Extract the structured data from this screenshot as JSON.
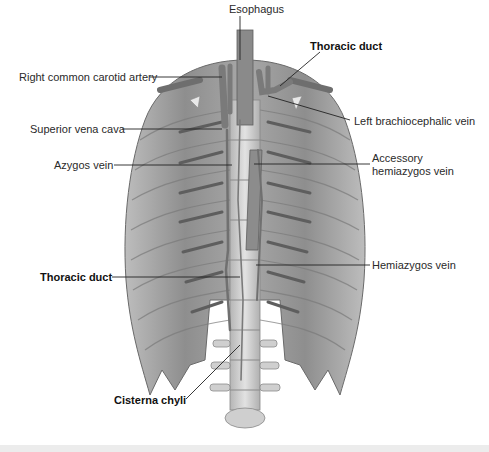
{
  "figure": {
    "type": "anatomical-diagram",
    "labels": [
      {
        "id": "esophagus",
        "text": "Esophagus",
        "bold": false,
        "x": 229,
        "y": 9
      },
      {
        "id": "thoracic-duct-top",
        "text": "Thoracic duct",
        "bold": true,
        "x": 310,
        "y": 46
      },
      {
        "id": "right-common-carotid-artery",
        "text": "Right common carotid artery",
        "bold": false,
        "x": 19,
        "y": 71
      },
      {
        "id": "left-brachiocephalic-vein",
        "text": "Left brachiocephalic vein",
        "bold": false,
        "x": 354,
        "y": 115
      },
      {
        "id": "superior-vena-cava",
        "text": "Superior vena cava",
        "bold": false,
        "x": 30,
        "y": 123
      },
      {
        "id": "azygos-vein",
        "text": "Azygos vein",
        "bold": false,
        "x": 54,
        "y": 159
      },
      {
        "id": "accessory-hemiazygos-vein-line1",
        "text": "Accessory",
        "bold": false,
        "x": 372,
        "y": 152
      },
      {
        "id": "accessory-hemiazygos-vein-line2",
        "text": "hemiazygos vein",
        "bold": false,
        "x": 372,
        "y": 165
      },
      {
        "id": "thoracic-duct-bottom",
        "text": "Thoracic duct",
        "bold": true,
        "x": 40,
        "y": 271
      },
      {
        "id": "hemiazygos-vein",
        "text": "Hemiazygos vein",
        "bold": false,
        "x": 372,
        "y": 259
      },
      {
        "id": "cisterna-chyli",
        "text": "Cisterna chyli",
        "bold": true,
        "x": 114,
        "y": 396
      }
    ],
    "colors": {
      "background": "#ffffff",
      "tissue": "#9a9a9a",
      "tissue_dark": "#6e6e6e",
      "tissue_light": "#c4c4c4",
      "vessel": "#7c7c7c",
      "bone": "#d6d6d6",
      "leader_line": "#222222",
      "label_text": "#2a2a2a"
    }
  }
}
